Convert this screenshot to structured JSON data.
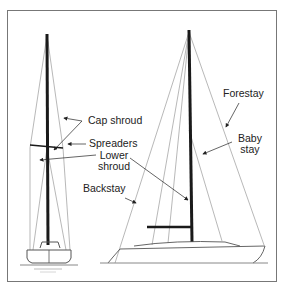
{
  "diagram": {
    "title": "",
    "labels": {
      "cap_shroud": "Cap shroud",
      "spreaders": "Spreaders",
      "lower_shroud_1": "Lower",
      "lower_shroud_2": "shroud",
      "backstay": "Backstay",
      "forestay": "Forestay",
      "baby_stay_1": "Baby",
      "baby_stay_2": "stay"
    },
    "views": [
      "front-view-sailboat",
      "side-view-sailboat"
    ],
    "colors": {
      "mast": "#1a1a1a",
      "rigging": "#8a8a8a",
      "hull": "#555555",
      "frame": "#777777",
      "text": "#222222"
    }
  }
}
